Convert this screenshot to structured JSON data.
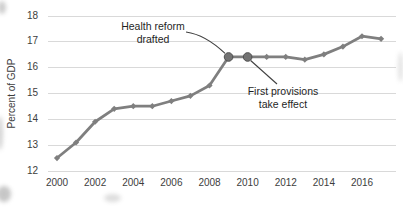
{
  "chart_data": {
    "type": "line",
    "title": "",
    "xlabel": "",
    "ylabel": "Percent of GDP",
    "x": [
      2000,
      2001,
      2002,
      2003,
      2004,
      2005,
      2006,
      2007,
      2008,
      2009,
      2010,
      2011,
      2012,
      2013,
      2014,
      2015,
      2016,
      2017
    ],
    "series": [
      {
        "name": "Percent of GDP",
        "values": [
          12.5,
          13.1,
          13.9,
          14.4,
          14.5,
          14.5,
          14.7,
          14.9,
          15.3,
          16.4,
          16.4,
          16.4,
          16.4,
          16.3,
          16.5,
          16.8,
          17.2,
          17.1
        ]
      }
    ],
    "ylim": [
      12,
      18
    ],
    "yticks": [
      12,
      13,
      14,
      15,
      16,
      17,
      18
    ],
    "xticks": [
      2000,
      2002,
      2004,
      2006,
      2008,
      2010,
      2012,
      2014,
      2016
    ],
    "grid": true,
    "grid_color": "#d9d9d9",
    "line_color": "#7f7f7f",
    "marker": "diamond",
    "legend_position": "none",
    "highlight_years": [
      2009,
      2010
    ],
    "highlight_fill": "#737373",
    "highlight_stroke": "#4e4e4e",
    "leader_line_color": "#404040",
    "annotations": [
      {
        "text": "Health reform drafted",
        "line1": "Health reform",
        "line2": "drafted",
        "target_year": 2009
      },
      {
        "text": "First provisions take effect",
        "line1": "First provisions",
        "line2": "take effect",
        "target_year": 2010
      }
    ]
  }
}
